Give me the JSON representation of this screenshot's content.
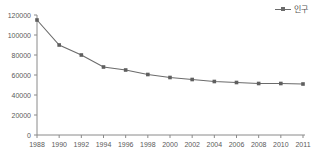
{
  "legend": {
    "series_label": "인구",
    "marker_icon": "line-marker-icon",
    "position": "top-right"
  },
  "colors": {
    "line": "#6b6b6b",
    "marker": "#5f5f5f",
    "axis": "#8a8a8a",
    "text": "#5a5a5a",
    "background": "#ffffff"
  },
  "chart_data": {
    "type": "line",
    "title": "",
    "subtitle": "",
    "xlabel": "",
    "ylabel": "",
    "categories": [
      "1988",
      "1990",
      "1992",
      "1994",
      "1996",
      "1998",
      "2000",
      "2002",
      "2004",
      "2006",
      "2008",
      "2010",
      "2011"
    ],
    "series": [
      {
        "name": "인구",
        "values": [
          115000,
          90000,
          80000,
          68000,
          65000,
          60500,
          57500,
          55500,
          53500,
          52500,
          51500,
          51500,
          51000
        ]
      }
    ],
    "ylim": [
      0,
      120000
    ],
    "yticks": [
      0,
      20000,
      40000,
      60000,
      80000,
      100000,
      120000
    ],
    "ytick_labels": [
      "0",
      "20000",
      "40000",
      "60000",
      "80000",
      "100000",
      "120000"
    ],
    "xtick_labels": [
      "1988",
      "1990",
      "1992",
      "1994",
      "1996",
      "1998",
      "2000",
      "2002",
      "2004",
      "2006",
      "2008",
      "2010",
      "2011"
    ],
    "grid": false,
    "legend_position": "top-right"
  }
}
